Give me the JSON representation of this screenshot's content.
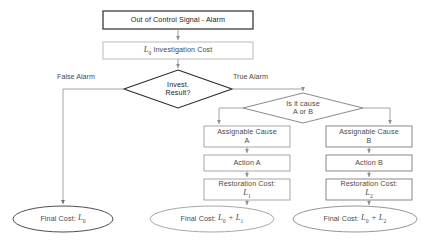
{
  "diagram": {
    "background_color": "#ffffff",
    "line_color": "#9a9a9a",
    "dark_line_color": "#2b2b2b",
    "text_color": "#4a4a4a"
  },
  "nodes": {
    "start": {
      "label": "Out of Control Signal - Alarm",
      "shape": "rectangle"
    },
    "investigation": {
      "label": "Investigation Cost",
      "symbol": "L",
      "subscript": "0",
      "shape": "rectangle"
    },
    "decision_invest": {
      "label": "Invest.\nResult?",
      "shape": "diamond"
    },
    "decision_cause": {
      "label": "Is it cause\nA or B",
      "shape": "diamond"
    },
    "cause_a": {
      "label": "Assignable Cause\nA",
      "shape": "rectangle"
    },
    "cause_b": {
      "label": "Assignable Cause\nB",
      "shape": "rectangle"
    },
    "action_a": {
      "label": "Action A",
      "shape": "rectangle"
    },
    "action_b": {
      "label": "Action B",
      "shape": "rectangle"
    },
    "restoration_a": {
      "label": "Restoration  Cost:",
      "symbol": "L",
      "subscript": "1",
      "shape": "rectangle"
    },
    "restoration_b": {
      "label": "Restoration  Cost:",
      "symbol": "L",
      "subscript": "2",
      "shape": "rectangle"
    },
    "final_false": {
      "label": "Final Cost:",
      "expression": "L0",
      "shape": "ellipse"
    },
    "final_a": {
      "label": "Final Cost:",
      "expression": "L0 + L1",
      "shape": "ellipse"
    },
    "final_b": {
      "label": "Final Cost:",
      "expression": "L0 + L2",
      "shape": "ellipse"
    }
  },
  "edge_labels": {
    "false_alarm": "False Alarm",
    "true_alarm": "True Alarm"
  }
}
